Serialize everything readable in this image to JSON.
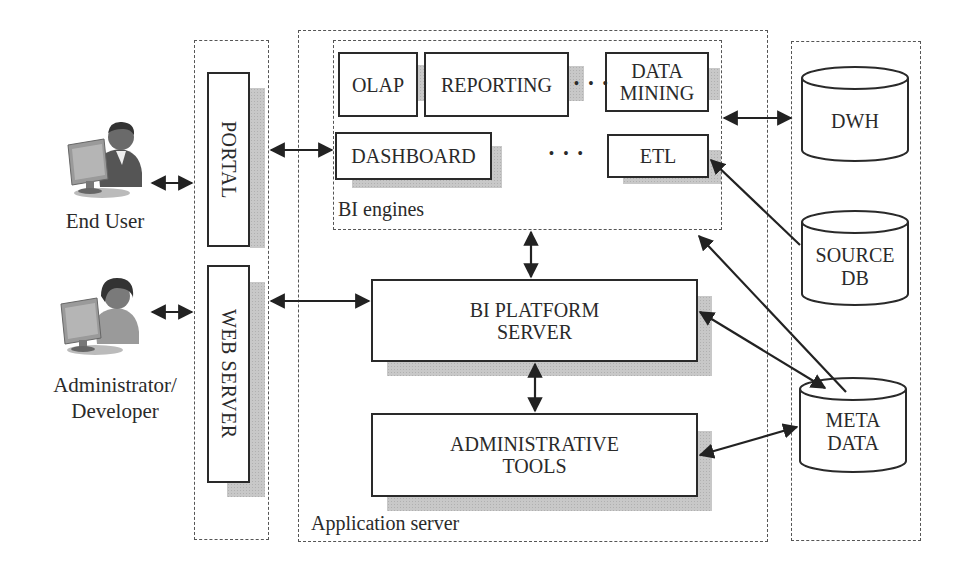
{
  "actors": {
    "end_user": "End User",
    "admin_line1": "Administrator/",
    "admin_line2": "Developer"
  },
  "gateway": {
    "portal": "PORTAL",
    "web_server": "WEB SERVER"
  },
  "app_server": {
    "label": "Application server",
    "bi_engines": {
      "label": "BI engines",
      "olap": "OLAP",
      "reporting": "REPORTING",
      "data_mining_line1": "DATA",
      "data_mining_line2": "MINING",
      "dashboard": "DASHBOARD",
      "etl": "ETL",
      "ellipsis": "• • •"
    },
    "platform_line1": "BI PLATFORM",
    "platform_line2": "SERVER",
    "admin_tools_line1": "ADMINISTRATIVE",
    "admin_tools_line2": "TOOLS"
  },
  "data_layer": {
    "dwh": "DWH",
    "source_line1": "SOURCE",
    "source_line2": "DB",
    "meta_line1": "META",
    "meta_line2": "DATA"
  }
}
